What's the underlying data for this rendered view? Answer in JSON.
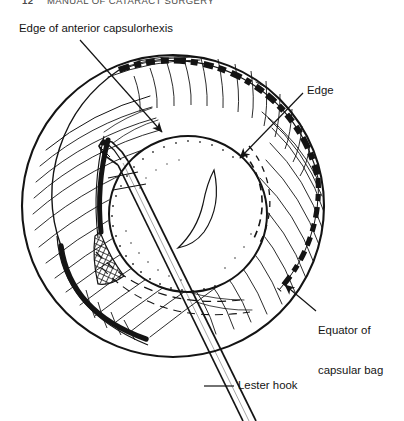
{
  "page": {
    "width": 404,
    "height": 421,
    "background": "#ffffff",
    "ink": "#141414"
  },
  "running_head": {
    "folio": "12",
    "title": "MANUAL OF CATARACT SURGERY",
    "clipped": true
  },
  "figure": {
    "line_color": "#141414",
    "fill_color": "#ffffff"
  },
  "labels": [
    {
      "id": "capsulorhexis",
      "name": "label-edge-of-anterior-capsulorhexis",
      "text": "Edge of anterior capsulorhexis",
      "leader": "line-with-arrowhead",
      "points_to": "thick dashed arc at the upper rim of the rhexis opening"
    },
    {
      "id": "edge",
      "name": "label-edge",
      "text": "Edge",
      "leader": "line-with-arrowhead",
      "points_to": "dashed arc on the right of the optic"
    },
    {
      "id": "equator",
      "name": "label-equator-of-capsular-bag",
      "text": "Equator of\ncapsular bag",
      "line1": "Equator of",
      "line2": "capsular bag",
      "leader": "line-with-arrowhead",
      "points_to": "outer circumference of the capsular bag, lower right"
    },
    {
      "id": "lester_hook",
      "name": "label-lester-hook",
      "text": "Lester hook",
      "leader": "horizontal-dash-line",
      "points_to": "instrument shaft entering from lower right"
    }
  ],
  "structures": [
    {
      "name": "capsular-bag-outline",
      "shape": "large circle",
      "cx": 173,
      "cy": 206,
      "r": 152
    },
    {
      "name": "capsular-bag-zonular-hatching",
      "shape": "radial curved hatch strokes inside outer ring"
    },
    {
      "name": "anterior-capsulorhexis-edge",
      "shape": "thick dashed arc",
      "style": "heavy broken arc over upper rim"
    },
    {
      "name": "iol-optic",
      "shape": "circle",
      "cx": 188,
      "cy": 214,
      "r": 78
    },
    {
      "name": "optic-highlight",
      "shape": "crescent reflex inside optic"
    },
    {
      "name": "optic-dashed-edge",
      "shape": "dashed arc right side of optic"
    },
    {
      "name": "lester-hook-shaft",
      "shape": "two parallel straight lines from lower right to optic"
    },
    {
      "name": "lester-hook-tip",
      "shape": "bent hook head engaging optic edge, upper left"
    },
    {
      "name": "stippled-shadow",
      "shape": "cross-hatched wedge beneath hook tip"
    },
    {
      "name": "posterior-capsule-fold",
      "shape": "thick black arc lower left of bag"
    }
  ]
}
